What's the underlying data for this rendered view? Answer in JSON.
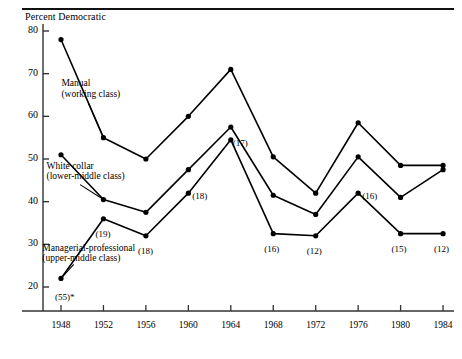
{
  "figure": {
    "axis_title": "Percent Democratic",
    "top_rule": true
  },
  "chart_data": {
    "type": "line",
    "title": "Percent Democratic",
    "xlabel": "",
    "ylabel": "Percent Democratic",
    "x": [
      1948,
      1952,
      1956,
      1960,
      1964,
      1968,
      1972,
      1976,
      1980,
      1984
    ],
    "xtick_labels": [
      "1948",
      "1952",
      "1956",
      "1960",
      "1964",
      "1968",
      "1972",
      "1976",
      "1980",
      "1984"
    ],
    "xlim": [
      1946,
      1986
    ],
    "ylim": [
      18,
      82
    ],
    "ytick_labels": [
      "20",
      "30",
      "40",
      "50",
      "60",
      "70",
      "80"
    ],
    "yticks": [
      20,
      30,
      40,
      50,
      60,
      70,
      80
    ],
    "grid": false,
    "legend": "inline-annotations",
    "series": [
      {
        "name": "Manual (working class)",
        "values": [
          78,
          55,
          50,
          60,
          71,
          50.5,
          42,
          58.5,
          48.5,
          48.5
        ],
        "marker": "filled-circle"
      },
      {
        "name": "White collar (lower-middle class)",
        "values": [
          51,
          40.5,
          37.5,
          47.5,
          57.5,
          41.5,
          37,
          50.5,
          41,
          47.5
        ],
        "marker": "filled-circle"
      },
      {
        "name": "Managerial-professional (upper-middle class)",
        "values": [
          22,
          36,
          32,
          42,
          54.5,
          32.5,
          32,
          42,
          32.5,
          32.5
        ],
        "marker": "filled-circle"
      }
    ],
    "annotations": [
      {
        "text": "Manual",
        "x": 1948.7,
        "y": 67.5
      },
      {
        "text": "(working class)",
        "x": 1948.7,
        "y": 65.0
      },
      {
        "text": "White collar",
        "x": 1947.3,
        "y": 48.2
      },
      {
        "text": "(lower-middle class)",
        "x": 1947.3,
        "y": 45.7
      },
      {
        "text": "Managerial-professional",
        "x": 1946.9,
        "y": 29.0
      },
      {
        "text": "(upper-middle class)",
        "x": 1946.9,
        "y": 26.6
      }
    ],
    "point_labels": [
      {
        "text": "(55)*",
        "series": "Managerial-professional (upper-middle class)",
        "x": 1948,
        "y": 22
      },
      {
        "text": "(19)",
        "series": "Managerial-professional (upper-middle class)",
        "x": 1952,
        "y": 36
      },
      {
        "text": "(18)",
        "series": "Managerial-professional (upper-middle class)",
        "x": 1956,
        "y": 32
      },
      {
        "text": "(18)",
        "series": "Managerial-professional (upper-middle class)",
        "x": 1960,
        "y": 42
      },
      {
        "text": "(17)",
        "series": "Managerial-professional (upper-middle class)",
        "x": 1964,
        "y": 54.5
      },
      {
        "text": "(16)",
        "series": "Managerial-professional (upper-middle class)",
        "x": 1968,
        "y": 32.5
      },
      {
        "text": "(12)",
        "series": "Managerial-professional (upper-middle class)",
        "x": 1972,
        "y": 32
      },
      {
        "text": "(16)",
        "series": "Managerial-professional (upper-middle class)",
        "x": 1976,
        "y": 42
      },
      {
        "text": "(15)",
        "series": "Managerial-professional (upper-middle class)",
        "x": 1980,
        "y": 32.5
      },
      {
        "text": "(12)",
        "series": "Managerial-professional (upper-middle class)",
        "x": 1984,
        "y": 32.5
      }
    ],
    "colors": {
      "line": "#000000",
      "marker": "#000000",
      "axis": "#333333",
      "background": "#ffffff"
    }
  }
}
